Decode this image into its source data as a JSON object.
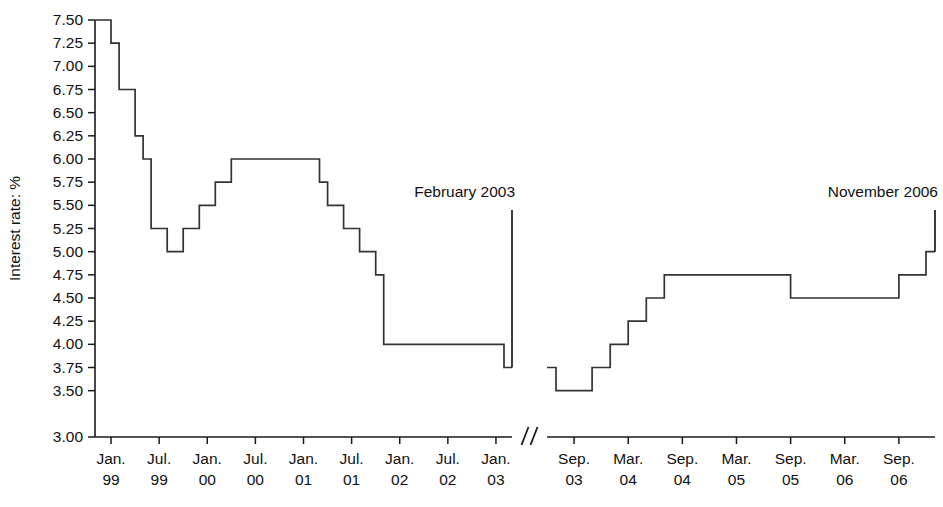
{
  "chart_data": {
    "type": "line",
    "title": "",
    "subtitle": "",
    "xlabel": "",
    "ylabel": "Interest rate: %",
    "ylim": [
      3.0,
      7.5
    ],
    "ytick_step": 0.25,
    "grid": false,
    "legend": null,
    "step_style": "post",
    "axis_break": {
      "symbol": "//",
      "between": [
        "Jan. 03",
        "Sep. 03"
      ]
    },
    "ytick_labels": [
      "7.50",
      "7.25",
      "7.00",
      "6.75",
      "6.50",
      "6.25",
      "6.00",
      "5.75",
      "5.50",
      "5.25",
      "5.00",
      "4.75",
      "4.50",
      "4.25",
      "4.00",
      "3.75",
      "3.50",
      "3.00"
    ],
    "ytick_values": [
      7.5,
      7.25,
      7.0,
      6.75,
      6.5,
      6.25,
      6.0,
      5.75,
      5.5,
      5.25,
      5.0,
      4.75,
      4.5,
      4.25,
      4.0,
      3.75,
      3.5,
      3.0
    ],
    "panels": [
      {
        "name": "left-panel",
        "xtick_labels": [
          {
            "month": "Jan.",
            "year": "99"
          },
          {
            "month": "Jul.",
            "year": "99"
          },
          {
            "month": "Jan.",
            "year": "00"
          },
          {
            "month": "Jul.",
            "year": "00"
          },
          {
            "month": "Jan.",
            "year": "01"
          },
          {
            "month": "Jul.",
            "year": "01"
          },
          {
            "month": "Jan.",
            "year": "02"
          },
          {
            "month": "Jul.",
            "year": "02"
          },
          {
            "month": "Jan.",
            "year": "03"
          }
        ],
        "annotation": "February 2003",
        "x_domain_months": [
          -2,
          50
        ],
        "series": [
          {
            "name": "Bank base rate",
            "points": [
              {
                "t": -2,
                "label": "Nov. 98",
                "value": 7.5
              },
              {
                "t": 0,
                "label": "Jan. 99",
                "value": 7.25
              },
              {
                "t": 1,
                "label": "Feb. 99",
                "value": 6.75
              },
              {
                "t": 3,
                "label": "Apr. 99",
                "value": 6.25
              },
              {
                "t": 4,
                "label": "May 99",
                "value": 6.0
              },
              {
                "t": 5,
                "label": "Jun. 99",
                "value": 5.25
              },
              {
                "t": 7,
                "label": "Aug. 99",
                "value": 5.0
              },
              {
                "t": 9,
                "label": "Oct. 99",
                "value": 5.25
              },
              {
                "t": 11,
                "label": "Dec. 99",
                "value": 5.5
              },
              {
                "t": 13,
                "label": "Feb. 00",
                "value": 5.75
              },
              {
                "t": 15,
                "label": "Apr. 00",
                "value": 6.0
              },
              {
                "t": 26,
                "label": "Mar. 01",
                "value": 5.75
              },
              {
                "t": 27,
                "label": "Apr. 01",
                "value": 5.5
              },
              {
                "t": 29,
                "label": "Jun. 01",
                "value": 5.25
              },
              {
                "t": 31,
                "label": "Aug. 01",
                "value": 5.0
              },
              {
                "t": 33,
                "label": "Oct. 01",
                "value": 4.75
              },
              {
                "t": 34,
                "label": "Nov. 01",
                "value": 4.0
              },
              {
                "t": 49,
                "label": "Feb. 03",
                "value": 3.75
              }
            ]
          }
        ]
      },
      {
        "name": "right-panel",
        "xtick_labels": [
          {
            "month": "Sep.",
            "year": "03"
          },
          {
            "month": "Mar.",
            "year": "04"
          },
          {
            "month": "Sep.",
            "year": "04"
          },
          {
            "month": "Mar.",
            "year": "05"
          },
          {
            "month": "Sep.",
            "year": "05"
          },
          {
            "month": "Mar.",
            "year": "06"
          },
          {
            "month": "Sep.",
            "year": "06"
          }
        ],
        "annotation": "November 2006",
        "x_domain_months": [
          -3,
          40
        ],
        "series": [
          {
            "name": "Bank base rate",
            "points": [
              {
                "t": -3,
                "label": "Jun. 03",
                "value": 3.75
              },
              {
                "t": -2,
                "label": "Jul. 03",
                "value": 3.5
              },
              {
                "t": 2,
                "label": "Nov. 03",
                "value": 3.75
              },
              {
                "t": 4,
                "label": "Jan. 04",
                "value": 4.0
              },
              {
                "t": 6,
                "label": "Mar. 04",
                "value": 4.25
              },
              {
                "t": 8,
                "label": "May 04",
                "value": 4.5
              },
              {
                "t": 10,
                "label": "Jul. 04",
                "value": 4.75
              },
              {
                "t": 24,
                "label": "Aug. 05",
                "value": 4.5
              },
              {
                "t": 36,
                "label": "Aug. 06",
                "value": 4.75
              },
              {
                "t": 39,
                "label": "Nov. 06",
                "value": 5.0
              }
            ]
          }
        ]
      }
    ]
  }
}
